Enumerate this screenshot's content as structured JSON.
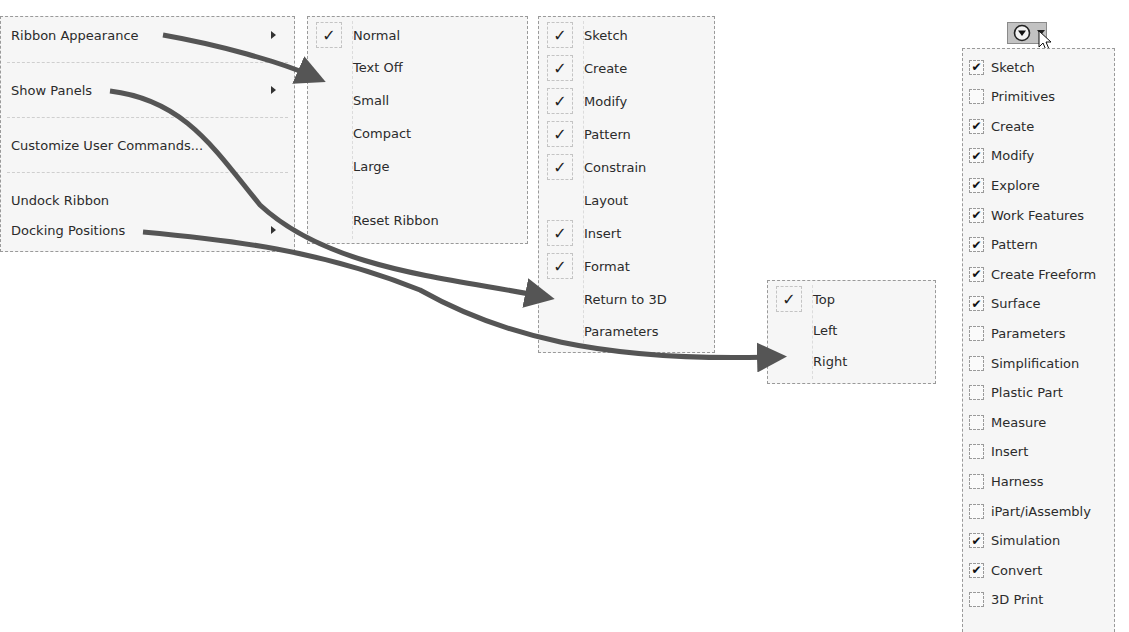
{
  "main_menu": {
    "items": [
      {
        "label": "Ribbon Appearance",
        "submenu": true
      },
      {
        "label": "Show Panels",
        "submenu": true
      },
      {
        "label": "Customize User Commands...",
        "submenu": false
      },
      {
        "label": "Undock Ribbon",
        "submenu": false
      },
      {
        "label": "Docking Positions",
        "submenu": true
      }
    ]
  },
  "ribbon_appearance_menu": {
    "items": [
      {
        "label": "Normal",
        "checked": true
      },
      {
        "label": "Text Off",
        "checked": false
      },
      {
        "label": "Small",
        "checked": false
      },
      {
        "label": "Compact",
        "checked": false
      },
      {
        "label": "Large",
        "checked": false
      },
      {
        "label": "Reset Ribbon",
        "checked": false
      }
    ]
  },
  "show_panels_menu": {
    "items": [
      {
        "label": "Sketch",
        "checked": true
      },
      {
        "label": "Create",
        "checked": true
      },
      {
        "label": "Modify",
        "checked": true
      },
      {
        "label": "Pattern",
        "checked": true
      },
      {
        "label": "Constrain",
        "checked": true
      },
      {
        "label": "Layout",
        "checked": false
      },
      {
        "label": "Insert",
        "checked": true
      },
      {
        "label": "Format",
        "checked": true
      },
      {
        "label": "Return to 3D",
        "checked": false
      },
      {
        "label": "Parameters",
        "checked": false
      }
    ]
  },
  "docking_positions_menu": {
    "items": [
      {
        "label": "Top",
        "checked": true
      },
      {
        "label": "Left",
        "checked": false
      },
      {
        "label": "Right",
        "checked": false
      }
    ]
  },
  "panel_dropdown": {
    "button_icon": "circle-down-arrow-icon",
    "check_glyph": "✔",
    "menu_check_glyph": "✓",
    "items": [
      {
        "label": "Sketch",
        "checked": true
      },
      {
        "label": "Primitives",
        "checked": false
      },
      {
        "label": "Create",
        "checked": true
      },
      {
        "label": "Modify",
        "checked": true
      },
      {
        "label": "Explore",
        "checked": true
      },
      {
        "label": "Work Features",
        "checked": true
      },
      {
        "label": "Pattern",
        "checked": true
      },
      {
        "label": "Create Freeform",
        "checked": true
      },
      {
        "label": "Surface",
        "checked": true
      },
      {
        "label": "Parameters",
        "checked": false
      },
      {
        "label": "Simplification",
        "checked": false
      },
      {
        "label": "Plastic Part",
        "checked": false
      },
      {
        "label": "Measure",
        "checked": false
      },
      {
        "label": "Insert",
        "checked": false
      },
      {
        "label": "Harness",
        "checked": false
      },
      {
        "label": "iPart/iAssembly",
        "checked": false
      },
      {
        "label": "Simulation",
        "checked": true
      },
      {
        "label": "Convert",
        "checked": true
      },
      {
        "label": "3D Print",
        "checked": false
      }
    ]
  },
  "colors": {
    "arrow": "#555555",
    "menu_bg": "#f6f6f6",
    "button_bg": "#c2c2c2"
  }
}
